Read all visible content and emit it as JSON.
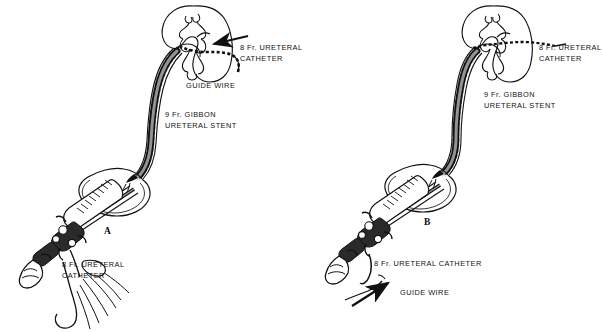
{
  "figure": {
    "background_color": "#ffffff",
    "ink_color": "#111111",
    "panels": [
      {
        "id": "A",
        "letter": "A",
        "labels": [
          {
            "name": "ureteral-catheter-label",
            "lines": [
              "8 Fr. URETERAL",
              "CATHETER"
            ],
            "x": 240,
            "y": 46
          },
          {
            "name": "guide-wire-label",
            "lines": [
              "GUIDE WIRE"
            ],
            "x": 186,
            "y": 83
          },
          {
            "name": "gibbon-stent-label",
            "lines": [
              "9 Fr. GIBBON",
              "URETERAL STENT"
            ],
            "x": 165,
            "y": 113
          },
          {
            "name": "ureteral-catheter-lower-label",
            "lines": [
              "8 Fr. URETERAL",
              "CATHETER"
            ],
            "x": 62,
            "y": 262
          }
        ]
      },
      {
        "id": "B",
        "letter": "B",
        "labels": [
          {
            "name": "ureteral-catheter-label",
            "lines": [
              "8 Fr. URETERAL",
              "CATHETER"
            ],
            "x": 539,
            "y": 46
          },
          {
            "name": "gibbon-stent-label",
            "lines": [
              "9 Fr. GIBBON",
              "URETERAL STENT"
            ],
            "x": 484,
            "y": 93
          },
          {
            "name": "ureteral-catheter-lower-label",
            "lines": [
              "8 Fr. URETERAL CATHETER"
            ],
            "x": 374,
            "y": 261
          },
          {
            "name": "guide-wire-label",
            "lines": [
              "GUIDE WIRE"
            ],
            "x": 400,
            "y": 290
          }
        ]
      }
    ],
    "anatomy_parts": [
      "kidney",
      "renal-calyces",
      "ureter",
      "bladder",
      "cystoscope",
      "guide-wire",
      "ureteral-catheter",
      "gibbon-ureteral-stent"
    ]
  }
}
